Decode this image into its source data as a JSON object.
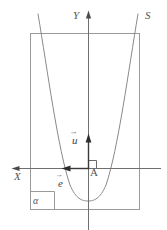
{
  "figure": {
    "background_color": "#ffffff",
    "stroke_color": "#8a8a8a",
    "axis_color": "#6f6f6f",
    "curve_color": "#7b7b7b",
    "label_color": "#555555",
    "width": 167,
    "height": 230
  },
  "labels": {
    "axis_y": "Y",
    "axis_x": "X",
    "curve": "S",
    "point_origin": "A",
    "plane": "α",
    "vector_u": "u",
    "vector_e": "e"
  },
  "elements": {
    "plane_rectangle": "plane-alpha-rectangle",
    "parabola": "parabola-curve",
    "y_axis": "y-axis-line",
    "x_axis": "x-axis-line",
    "vector_u_arrow": "vector-u-arrow",
    "vector_e_arrow": "vector-e-arrow",
    "right_angle": "right-angle-marker",
    "alpha_box": "plane-label-box"
  },
  "geometry": {
    "plane_rect": {
      "x": 30,
      "y": 33,
      "width": 110,
      "height": 177
    },
    "origin": {
      "x": 88,
      "y": 168
    },
    "parabola_vertex": {
      "x": 88,
      "y": 200
    },
    "y_axis_from": {
      "x": 88,
      "y": 12
    },
    "y_axis_to": {
      "x": 88,
      "y": 229
    },
    "x_axis_from": {
      "x": 13,
      "y": 168
    },
    "x_axis_to": {
      "x": 161,
      "y": 168
    },
    "vector_u_tip": {
      "x": 88,
      "y": 134
    },
    "vector_e_tip": {
      "x": 62,
      "y": 168
    },
    "alpha_box": {
      "x": 30,
      "y": 191,
      "width": 24,
      "height": 19
    }
  }
}
